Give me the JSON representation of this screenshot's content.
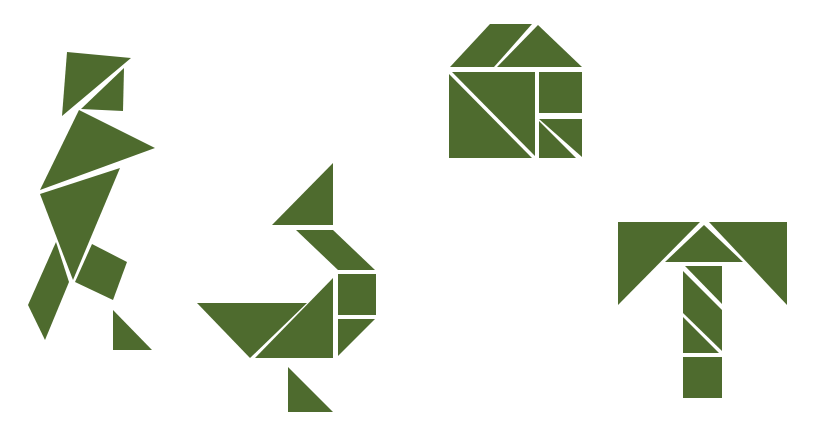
{
  "canvas": {
    "width": 817,
    "height": 440,
    "background": "#ffffff"
  },
  "colors": {
    "piece_fill": "#4e6b2e",
    "gap": "#ffffff"
  },
  "figures": [
    {
      "name": "walking-person",
      "pieces": [
        {
          "type": "medium-triangle",
          "points": "67,52 131,58 62,116"
        },
        {
          "type": "small-triangle",
          "points": "124,68 123,111 81,109"
        },
        {
          "type": "large-triangle",
          "points": "79,110 155,148 40,190"
        },
        {
          "type": "large-triangle",
          "points": "40,194 120,168 73,280"
        },
        {
          "type": "parallelogram",
          "points": "56,242 69,282 45,340 28,305"
        },
        {
          "type": "square",
          "points": "92,244 127,262 113,300 75,282"
        },
        {
          "type": "small-triangle",
          "points": "113,310 113,350 152,350"
        }
      ]
    },
    {
      "name": "bird",
      "pieces": [
        {
          "type": "medium-triangle",
          "points": "333,163 333,225 272,225"
        },
        {
          "type": "parallelogram",
          "points": "296,230 333,230 375,270 338,270"
        },
        {
          "type": "square",
          "points": "338,274 376,274 376,315 338,315"
        },
        {
          "type": "small-triangle",
          "points": "338,319 375,319 338,356"
        },
        {
          "type": "large-triangle",
          "points": "333,278 333,358 255,358"
        },
        {
          "type": "large-triangle",
          "points": "197,303 307,303 250,358"
        },
        {
          "type": "small-triangle",
          "points": "288,367 288,412 333,412"
        }
      ]
    },
    {
      "name": "house",
      "pieces": [
        {
          "type": "parallelogram",
          "points": "490,24 532,24 494,67 450,67"
        },
        {
          "type": "medium-triangle",
          "points": "538,25 582,67 497,67"
        },
        {
          "type": "large-triangle",
          "points": "449,74 532,158 449,158"
        },
        {
          "type": "large-triangle",
          "points": "452,72 535,72 535,156"
        },
        {
          "type": "square",
          "points": "539,72 582,72 582,113 539,113"
        },
        {
          "type": "small-triangle",
          "points": "539,119 582,119 582,157"
        },
        {
          "type": "small-triangle",
          "points": "539,121 576,158 539,158"
        }
      ]
    },
    {
      "name": "letter-t",
      "pieces": [
        {
          "type": "large-triangle",
          "points": "618,222 700,222 618,305"
        },
        {
          "type": "large-triangle",
          "points": "709,222 787,222 787,305"
        },
        {
          "type": "medium-triangle",
          "points": "704,225 743,262 665,262"
        },
        {
          "type": "small-triangle",
          "points": "685,266 722,266 722,304"
        },
        {
          "type": "parallelogram",
          "points": "683,271 722,310 722,351 683,313"
        },
        {
          "type": "small-triangle",
          "points": "683,317 719,353 683,353"
        },
        {
          "type": "square",
          "points": "683,357 722,357 722,398 683,398"
        }
      ]
    }
  ]
}
